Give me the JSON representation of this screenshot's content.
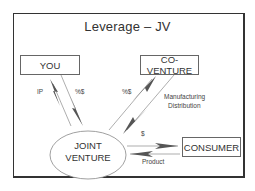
{
  "title": "Leverage – JV",
  "nodes": {
    "you": "YOU",
    "co_venture": "CO-VENTURE",
    "joint_venture_line1": "JOINT",
    "joint_venture_line2": "VENTURE",
    "consumer": "CONSUMER"
  },
  "edges": {
    "jv_to_you": "IP",
    "you_to_jv": "%$",
    "jv_to_coventure": "%$",
    "coventure_to_jv_line1": "Manufacturing",
    "coventure_to_jv_line2": "Distribution",
    "jv_to_consumer": "$",
    "consumer_to_jv": "Product"
  },
  "colors": {
    "frame": "#333333",
    "text": "#333333",
    "arrow": "#555555"
  }
}
